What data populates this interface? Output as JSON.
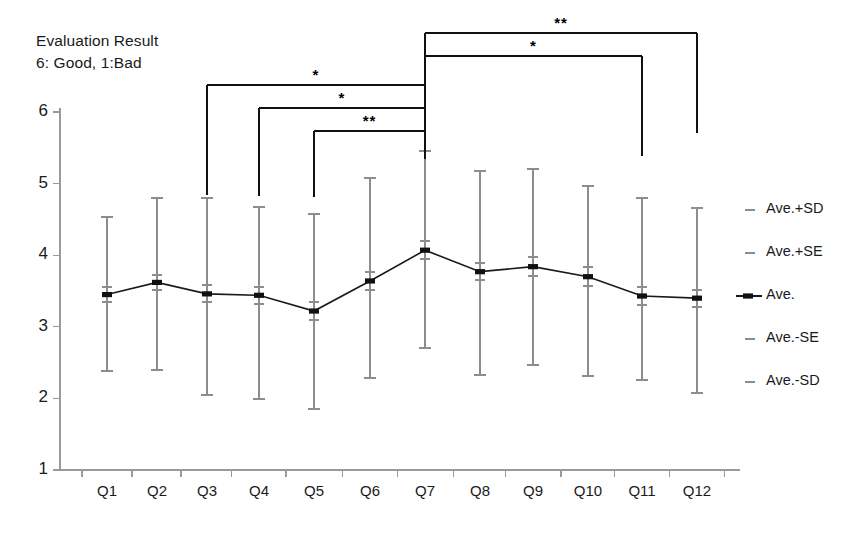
{
  "title": {
    "line1": "Evaluation Result",
    "line2": "6: Good, 1:Bad"
  },
  "axes": {
    "y_ticks": [
      "6",
      "5",
      "4",
      "3",
      "2",
      "1"
    ],
    "x_ticks": [
      "Q1",
      "Q2",
      "Q3",
      "Q4",
      "Q5",
      "Q6",
      "Q7",
      "Q8",
      "Q9",
      "Q10",
      "Q11",
      "Q12"
    ]
  },
  "legend": {
    "items": [
      {
        "label": "Ave.+SD",
        "marker": "short-dash-marker"
      },
      {
        "label": "Ave.+SE",
        "marker": "short-dash-marker"
      },
      {
        "label": "Ave.",
        "marker": "line-with-square-marker"
      },
      {
        "label": "Ave.-SE",
        "marker": "short-dash-marker"
      },
      {
        "label": "Ave.-SD",
        "marker": "short-dash-marker"
      }
    ]
  },
  "annotations": {
    "brackets": [
      {
        "label": "**",
        "from": "Q7",
        "to": "Q12"
      },
      {
        "label": "*",
        "from": "Q7",
        "to": "Q11"
      },
      {
        "label": "*",
        "from": "Q3",
        "to": "Q7"
      },
      {
        "label": "*",
        "from": "Q4",
        "to": "Q7"
      },
      {
        "label": "**",
        "from": "Q5",
        "to": "Q7"
      }
    ]
  },
  "chart_data": {
    "type": "line",
    "title": "Evaluation Result  6: Good, 1:Bad",
    "xlabel": "",
    "ylabel": "Evaluation Result",
    "ylim": [
      1,
      6
    ],
    "grid": false,
    "legend_position": "right",
    "categories": [
      "Q1",
      "Q2",
      "Q3",
      "Q4",
      "Q5",
      "Q6",
      "Q7",
      "Q8",
      "Q9",
      "Q10",
      "Q11",
      "Q12"
    ],
    "series": [
      {
        "name": "Ave.",
        "values": [
          3.45,
          3.62,
          3.46,
          3.44,
          3.22,
          3.64,
          4.07,
          3.77,
          3.84,
          3.7,
          3.43,
          3.4
        ]
      },
      {
        "name": "Ave.+SD",
        "values": [
          4.53,
          4.8,
          4.8,
          4.68,
          4.58,
          5.08,
          5.45,
          5.17,
          5.2,
          4.96,
          4.8,
          4.66
        ]
      },
      {
        "name": "Ave.-SD",
        "values": [
          2.38,
          2.4,
          2.05,
          1.99,
          1.85,
          2.29,
          2.7,
          2.32,
          2.47,
          2.31,
          2.26,
          2.08
        ]
      },
      {
        "name": "Ave.+SE",
        "values": [
          3.56,
          3.73,
          3.58,
          3.56,
          3.34,
          3.77,
          4.2,
          3.89,
          3.97,
          3.83,
          3.55,
          3.52
        ]
      },
      {
        "name": "Ave.-SE",
        "values": [
          3.34,
          3.51,
          3.34,
          3.32,
          3.1,
          3.51,
          3.94,
          3.65,
          3.71,
          3.57,
          3.31,
          3.28
        ]
      }
    ],
    "significance": [
      {
        "label": "**",
        "from": "Q7",
        "to": "Q12"
      },
      {
        "label": "*",
        "from": "Q7",
        "to": "Q11"
      },
      {
        "label": "*",
        "from": "Q3",
        "to": "Q7"
      },
      {
        "label": "*",
        "from": "Q4",
        "to": "Q7"
      },
      {
        "label": "**",
        "from": "Q5",
        "to": "Q7"
      }
    ]
  }
}
